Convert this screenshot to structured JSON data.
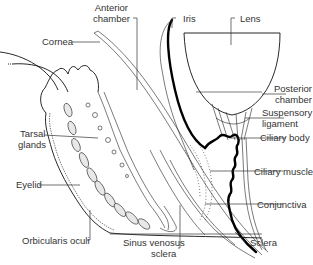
{
  "diagram": {
    "labels": {
      "anterior_chamber": [
        "Anterior",
        "chamber"
      ],
      "iris": "Iris",
      "lens": "Lens",
      "cornea": "Cornea",
      "posterior_chamber": [
        "Posterior",
        "chamber"
      ],
      "suspensory_ligament": [
        "Suspensory",
        "ligament"
      ],
      "tarsal_glands": [
        "Tarsal",
        "glands"
      ],
      "ciliary_body": "Ciliary body",
      "eyelid": "Eyelid",
      "ciliary_muscle": "Ciliary muscle",
      "conjunctiva": "Conjunctiva",
      "orbicularis_oculi": "Orbicularis oculi",
      "sinus_venosus_sclera": [
        "Sinus venosus",
        "sclera"
      ],
      "sclera": "Sclera"
    }
  }
}
